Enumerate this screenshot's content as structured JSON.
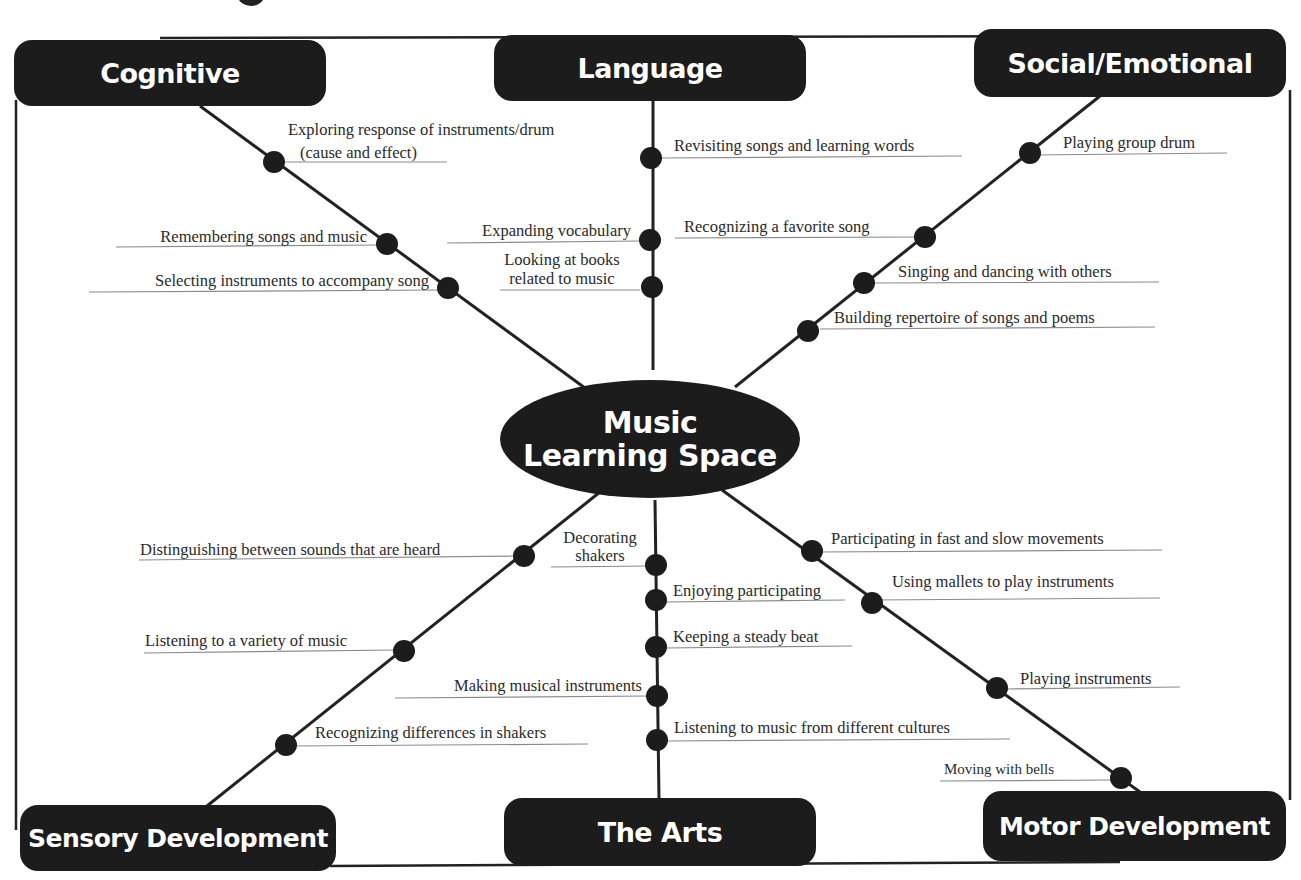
{
  "center": {
    "line1": "Music",
    "line2": "Learning Space"
  },
  "categories": {
    "cognitive": "Cognitive",
    "language": "Language",
    "social": "Social/Emotional",
    "sensory": "Sensory Development",
    "arts": "The Arts",
    "motor": "Motor Development"
  },
  "items": {
    "cognitive": [
      "Exploring response of instruments/drum",
      "(cause and effect)",
      "Remembering songs and music",
      "Selecting instruments to accompany song"
    ],
    "language": [
      "Revisiting songs and learning words",
      "Expanding vocabulary",
      "Looking at books",
      "related to music"
    ],
    "social": [
      "Playing group drum",
      "Recognizing a favorite song",
      "Singing and dancing with others",
      "Building repertoire of songs and poems"
    ],
    "sensory": [
      "Distinguishing between sounds that are heard",
      "Listening to a variety of music",
      "Recognizing differences in shakers"
    ],
    "arts": [
      "Decorating",
      "shakers",
      "Enjoying participating",
      "Keeping a steady beat",
      "Making musical instruments",
      "Listening to music from different cultures"
    ],
    "motor": [
      "Participating in fast and slow movements",
      "Using mallets to play instruments",
      "Playing instruments",
      "Moving with bells"
    ]
  },
  "colors": {
    "node": "#1c1c1c",
    "text": "#2a2a2a",
    "underline": "#8a8a8a",
    "background": "#ffffff"
  }
}
